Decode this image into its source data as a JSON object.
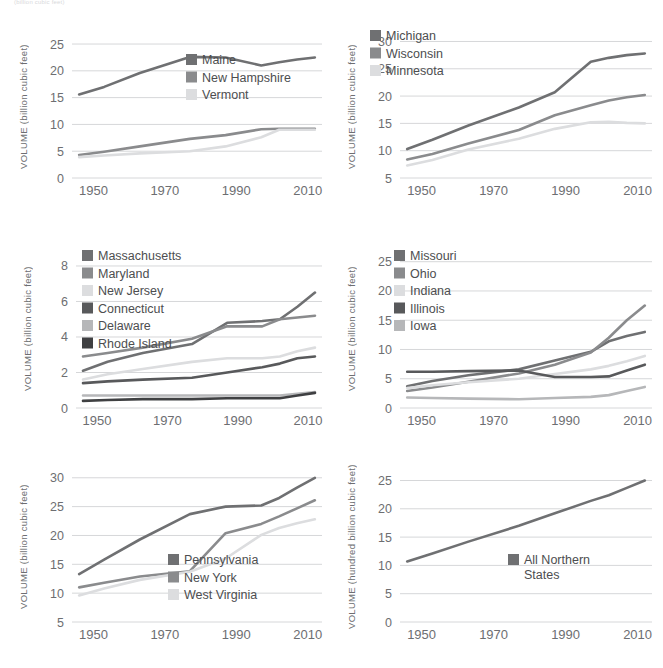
{
  "page": {
    "cropped_caption": "(billion cubic feet)",
    "axis_title_billion": "VOLUME  (billion cubic feet)",
    "axis_title_hundred_billion": "VOLUME  (hundred billion cubic feet)"
  },
  "palette": {
    "s1": "#6f7072",
    "s2": "#8a8b8d",
    "s3": "#dcdddf",
    "s4": "#58595b",
    "s5": "#b6b7b9",
    "s6": "#3f4042",
    "grid": "#d6d7d9",
    "text": "#6d6e71"
  },
  "chart_data": [
    {
      "id": "northern-new-england",
      "type": "line",
      "title": "",
      "xlabel": "",
      "ylabel": "VOLUME  (billion cubic feet)",
      "x": [
        1946,
        1953,
        1963,
        1977,
        1987,
        1997,
        2002,
        2007,
        2012
      ],
      "xticks": [
        1950,
        1970,
        1990,
        2010
      ],
      "xlim": [
        1944,
        2014
      ],
      "ylim": [
        0,
        26.5
      ],
      "yticks": [
        0,
        5,
        10,
        15,
        20,
        25
      ],
      "grid": true,
      "legend_position": "center-right",
      "series": [
        {
          "name": "Maine",
          "color": "#6f7072",
          "values": [
            15.6,
            17.0,
            19.6,
            22.6,
            22.5,
            21.0,
            21.6,
            22.1,
            22.5
          ]
        },
        {
          "name": "New Hampshire",
          "color": "#8a8b8d",
          "values": [
            4.3,
            4.9,
            5.9,
            7.3,
            8.0,
            9.1,
            9.2,
            9.2,
            9.2
          ]
        },
        {
          "name": "Vermont",
          "color": "#dcdddf",
          "values": [
            3.9,
            4.2,
            4.6,
            5.0,
            5.9,
            7.6,
            9.0,
            9.0,
            9.0
          ]
        }
      ]
    },
    {
      "id": "lake-states",
      "type": "line",
      "title": "",
      "xlabel": "",
      "ylabel": "VOLUME  (billion cubic feet)",
      "x": [
        1946,
        1953,
        1963,
        1977,
        1987,
        1997,
        2002,
        2007,
        2012
      ],
      "xticks": [
        1950,
        1970,
        1990,
        2010
      ],
      "xlim": [
        1944,
        2014
      ],
      "ylim": [
        5,
        31
      ],
      "yticks": [
        5,
        10,
        15,
        20,
        25,
        30
      ],
      "grid": true,
      "legend_position": "top-left",
      "series": [
        {
          "name": "Michigan",
          "color": "#6f7072",
          "values": [
            10.3,
            12.0,
            14.6,
            17.9,
            20.7,
            26.3,
            27.0,
            27.5,
            27.8
          ]
        },
        {
          "name": "Wisconsin",
          "color": "#8a8b8d",
          "values": [
            8.4,
            9.4,
            11.3,
            13.8,
            16.5,
            18.3,
            19.2,
            19.8,
            20.2
          ]
        },
        {
          "name": "Minnesota",
          "color": "#dcdddf",
          "values": [
            7.3,
            8.3,
            10.2,
            12.2,
            14.0,
            15.2,
            15.3,
            15.1,
            15.0
          ]
        }
      ]
    },
    {
      "id": "mid-atlantic-new-england",
      "type": "line",
      "title": "",
      "xlabel": "",
      "ylabel": "VOLUME  (billion cubic feet)",
      "x": [
        1946,
        1953,
        1963,
        1977,
        1987,
        1997,
        2002,
        2007,
        2012
      ],
      "xticks": [
        1950,
        1970,
        1990,
        2010
      ],
      "xlim": [
        1944,
        2014
      ],
      "ylim": [
        0,
        8.9
      ],
      "yticks": [
        0,
        2,
        4,
        6,
        8
      ],
      "grid": true,
      "legend_position": "top-left",
      "series": [
        {
          "name": "Massachusetts",
          "color": "#6f7072",
          "values": [
            2.1,
            2.6,
            3.1,
            3.6,
            4.8,
            4.9,
            5.0,
            5.7,
            6.5
          ]
        },
        {
          "name": "Maryland",
          "color": "#8a8b8d",
          "values": [
            2.9,
            3.1,
            3.4,
            3.9,
            4.6,
            4.6,
            5.0,
            5.1,
            5.2
          ]
        },
        {
          "name": "New Jersey",
          "color": "#dcdddf",
          "values": [
            1.6,
            1.9,
            2.2,
            2.6,
            2.8,
            2.8,
            2.9,
            3.2,
            3.4
          ]
        },
        {
          "name": "Connecticut",
          "color": "#58595b",
          "values": [
            1.4,
            1.5,
            1.6,
            1.7,
            2.0,
            2.3,
            2.5,
            2.8,
            2.9
          ]
        },
        {
          "name": "Delaware",
          "color": "#b6b7b9",
          "values": [
            0.7,
            0.7,
            0.7,
            0.7,
            0.7,
            0.7,
            0.7,
            0.8,
            0.9
          ]
        },
        {
          "name": "Rhode Island",
          "color": "#3f4042",
          "values": [
            0.4,
            0.45,
            0.5,
            0.5,
            0.55,
            0.55,
            0.55,
            0.7,
            0.85
          ]
        }
      ]
    },
    {
      "id": "central-states",
      "type": "line",
      "title": "",
      "xlabel": "",
      "ylabel": "VOLUME  (billion cubic feet)",
      "x": [
        1946,
        1953,
        1963,
        1977,
        1987,
        1997,
        2002,
        2007,
        2012
      ],
      "xticks": [
        1950,
        1970,
        1990,
        2010
      ],
      "xlim": [
        1944,
        2014
      ],
      "ylim": [
        0,
        27
      ],
      "yticks": [
        0,
        5,
        10,
        15,
        20,
        25
      ],
      "grid": true,
      "legend_position": "top-left",
      "series": [
        {
          "name": "Missouri",
          "color": "#6f7072",
          "values": [
            3.7,
            4.6,
            5.6,
            6.6,
            8.1,
            9.6,
            11.4,
            12.3,
            13.0
          ]
        },
        {
          "name": "Ohio",
          "color": "#8a8b8d",
          "values": [
            2.9,
            3.5,
            4.5,
            5.9,
            7.4,
            9.5,
            12.0,
            15.0,
            17.5
          ]
        },
        {
          "name": "Indiana",
          "color": "#dcdddf",
          "values": [
            3.4,
            3.9,
            4.4,
            5.0,
            5.8,
            6.6,
            7.2,
            8.0,
            8.9
          ]
        },
        {
          "name": "Illinois",
          "color": "#58595b",
          "values": [
            6.2,
            6.2,
            6.3,
            6.4,
            5.3,
            5.3,
            5.4,
            6.4,
            7.4
          ]
        },
        {
          "name": "Iowa",
          "color": "#b6b7b9",
          "values": [
            1.8,
            1.7,
            1.6,
            1.5,
            1.7,
            1.9,
            2.2,
            2.9,
            3.6
          ]
        }
      ]
    },
    {
      "id": "penn-ny-wv",
      "type": "line",
      "title": "",
      "xlabel": "",
      "ylabel": "VOLUME  (billion cubic feet)",
      "x": [
        1946,
        1953,
        1963,
        1977,
        1987,
        1997,
        2002,
        2007,
        2012
      ],
      "xticks": [
        1950,
        1970,
        1990,
        2010
      ],
      "xlim": [
        1944,
        2014
      ],
      "ylim": [
        5,
        31
      ],
      "yticks": [
        5,
        10,
        15,
        20,
        25,
        30
      ],
      "grid": true,
      "legend_position": "bottom-right",
      "series": [
        {
          "name": "Pennsylvania",
          "color": "#6f7072",
          "values": [
            13.3,
            15.8,
            19.3,
            23.7,
            25.0,
            25.2,
            26.5,
            28.3,
            30.0
          ]
        },
        {
          "name": "New York",
          "color": "#8a8b8d",
          "values": [
            11.0,
            11.8,
            12.9,
            13.8,
            20.4,
            22.0,
            23.3,
            24.7,
            26.1
          ]
        },
        {
          "name": "West Virginia",
          "color": "#dcdddf",
          "values": [
            9.6,
            10.8,
            12.3,
            13.7,
            16.0,
            20.1,
            21.3,
            22.1,
            22.8
          ]
        }
      ]
    },
    {
      "id": "all-northern-states",
      "type": "line",
      "title": "",
      "xlabel": "",
      "ylabel": "VOLUME  (hundred billion cubic feet)",
      "x": [
        1946,
        1953,
        1963,
        1977,
        1987,
        1997,
        2002,
        2007,
        2012
      ],
      "xticks": [
        1950,
        1970,
        1990,
        2010
      ],
      "xlim": [
        1944,
        2014
      ],
      "ylim": [
        0,
        26.5
      ],
      "yticks": [
        0,
        5,
        10,
        15,
        20,
        25
      ],
      "grid": true,
      "legend_position": "bottom-right",
      "series": [
        {
          "name": "All Northern States",
          "color": "#6f7072",
          "values": [
            10.7,
            12.1,
            14.2,
            17.0,
            19.2,
            21.4,
            22.4,
            23.7,
            25.0
          ]
        }
      ]
    }
  ]
}
